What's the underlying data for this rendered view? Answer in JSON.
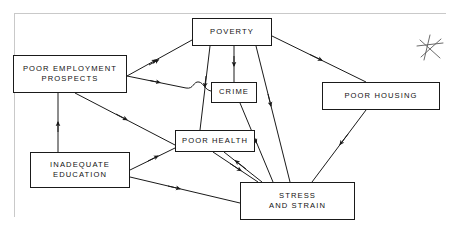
{
  "diagram": {
    "background_color": "#ffffff",
    "line_color": "#1a1a1a",
    "text_color": "#111111",
    "frame_color": "#c9c9c9",
    "nodes": [
      {
        "id": "poor-employment-prospects",
        "label": "POOR EMPLOYMENT\nPROSPECTS",
        "x": 13,
        "y": 55,
        "width": 114,
        "height": 38
      },
      {
        "id": "poverty",
        "label": "POVERTY",
        "x": 192,
        "y": 18,
        "width": 80,
        "height": 28
      },
      {
        "id": "crime",
        "label": "CRIME",
        "x": 211,
        "y": 82,
        "width": 46,
        "height": 21
      },
      {
        "id": "poor-housing",
        "label": "POOR HOUSING",
        "x": 322,
        "y": 82,
        "width": 118,
        "height": 28
      },
      {
        "id": "poor-health",
        "label": "POOR HEALTH",
        "x": 175,
        "y": 130,
        "width": 80,
        "height": 22
      },
      {
        "id": "inadequate-education",
        "label": "INADEQUATE\nEDUCATION",
        "x": 30,
        "y": 152,
        "width": 100,
        "height": 36
      },
      {
        "id": "stress-and-strain",
        "label": "STRESS\nAND STRAIN",
        "x": 240,
        "y": 182,
        "width": 115,
        "height": 38
      }
    ],
    "marks": [
      {
        "id": "star-mark",
        "label": "star-annotation",
        "x": 415,
        "y": 33,
        "size": 30
      }
    ],
    "edges": [
      {
        "id": "employment-to-poverty",
        "from": "poor-employment-prospects",
        "to": "poverty"
      },
      {
        "id": "employment-to-crime",
        "from": "poor-employment-prospects",
        "to": "crime"
      },
      {
        "id": "employment-to-poor-health",
        "from": "poor-employment-prospects",
        "to": "poor-health"
      },
      {
        "id": "education-to-employment",
        "from": "inadequate-education",
        "to": "poor-employment-prospects"
      },
      {
        "id": "education-to-poor-health",
        "from": "inadequate-education",
        "to": "poor-health"
      },
      {
        "id": "education-to-stress",
        "from": "inadequate-education",
        "to": "stress-and-strain"
      },
      {
        "id": "poverty-to-crime",
        "from": "poverty",
        "to": "crime"
      },
      {
        "id": "poverty-to-poor-health",
        "from": "poverty",
        "to": "poor-health"
      },
      {
        "id": "poverty-to-stress",
        "from": "poverty",
        "to": "stress-and-strain"
      },
      {
        "id": "poverty-to-poor-housing",
        "from": "poverty",
        "to": "poor-housing"
      },
      {
        "id": "crime-to-stress",
        "from": "crime",
        "to": "stress-and-strain"
      },
      {
        "id": "poor-health-to-stress",
        "from": "poor-health",
        "to": "stress-and-strain"
      },
      {
        "id": "stress-to-poor-health",
        "from": "stress-and-strain",
        "to": "poor-health"
      },
      {
        "id": "poor-housing-to-stress",
        "from": "poor-housing",
        "to": "stress-and-strain"
      }
    ]
  }
}
